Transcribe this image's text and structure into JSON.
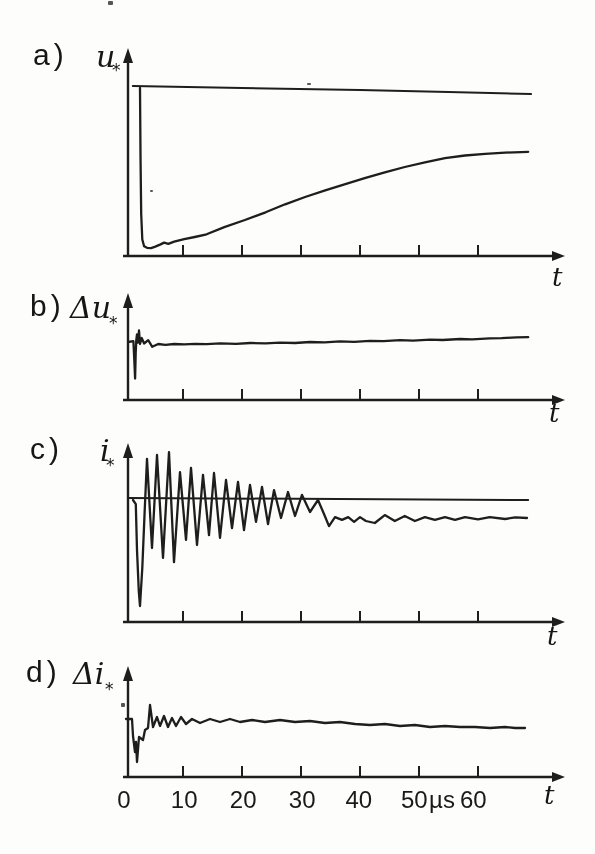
{
  "figure": {
    "background": "#fdfdfb",
    "ink": "#1e1e1e",
    "x_axis_unit": "µs",
    "x_axis_labels": [
      {
        "text": "0",
        "t_us": 0
      },
      {
        "text": "10",
        "t_us": 10.2
      },
      {
        "text": "20",
        "t_us": 20.2
      },
      {
        "text": "30",
        "t_us": 30.2
      },
      {
        "text": "40",
        "t_us": 39.8
      },
      {
        "text": "50",
        "t_us": 49.2
      },
      {
        "text": "µs",
        "t_us": 53.9
      },
      {
        "text": "60",
        "t_us": 59.2
      }
    ]
  },
  "chart_data": [
    {
      "type": "line",
      "panel": "a",
      "tag": "a)",
      "ylabel": "u",
      "ylabel_sub": "*",
      "xlabel": "t",
      "x_unit": "µs",
      "x_range_us": [
        0,
        74
      ],
      "x_ticks_us": [
        10,
        20,
        30,
        40,
        50,
        60
      ],
      "y_units": "normalized 0-1 of panel height",
      "series": [
        {
          "name": "reference-level",
          "role": "reference",
          "points": [
            [
              1.5,
              1.012
            ],
            [
              20,
              1.0
            ],
            [
              40,
              0.988
            ],
            [
              55,
              0.976
            ],
            [
              69,
              0.964
            ]
          ]
        },
        {
          "name": "u-transient",
          "role": "signal",
          "points": [
            [
              2.71,
              1.0
            ],
            [
              2.8,
              0.6
            ],
            [
              2.92,
              0.25
            ],
            [
              3.1,
              0.098
            ],
            [
              3.4,
              0.058
            ],
            [
              3.9,
              0.049
            ],
            [
              4.6,
              0.047
            ],
            [
              5.3,
              0.056
            ],
            [
              6.1,
              0.068
            ],
            [
              6.8,
              0.08
            ],
            [
              7.5,
              0.072
            ],
            [
              8.5,
              0.086
            ],
            [
              10.2,
              0.1
            ],
            [
              12,
              0.113
            ],
            [
              14,
              0.129
            ],
            [
              17,
              0.172
            ],
            [
              20.5,
              0.214
            ],
            [
              24,
              0.26
            ],
            [
              27.3,
              0.308
            ],
            [
              30.7,
              0.351
            ],
            [
              34.1,
              0.391
            ],
            [
              37.5,
              0.428
            ],
            [
              40.8,
              0.463
            ],
            [
              44.2,
              0.498
            ],
            [
              47.6,
              0.53
            ],
            [
              51,
              0.558
            ],
            [
              54.4,
              0.582
            ],
            [
              57.8,
              0.598
            ],
            [
              61.2,
              0.608
            ],
            [
              64.6,
              0.615
            ],
            [
              68.5,
              0.62
            ]
          ]
        }
      ]
    },
    {
      "type": "line",
      "panel": "b",
      "tag": "b)",
      "ylabel": "Δu",
      "ylabel_sub": "*",
      "xlabel": "t",
      "x_unit": "µs",
      "x_range_us": [
        0,
        74
      ],
      "x_ticks_us": [
        10,
        20,
        30,
        40,
        50,
        60
      ],
      "y_units": "normalized 0-1 of panel height",
      "series": [
        {
          "name": "delta-u",
          "role": "signal",
          "points": [
            [
              0.7,
              0.58
            ],
            [
              1.6,
              0.588
            ],
            [
              1.75,
              0.4
            ],
            [
              1.88,
              0.215
            ],
            [
              1.98,
              0.47
            ],
            [
              2.08,
              0.6
            ],
            [
              2.2,
              0.655
            ],
            [
              2.37,
              0.575
            ],
            [
              2.55,
              0.695
            ],
            [
              2.72,
              0.56
            ],
            [
              3,
              0.62
            ],
            [
              3.4,
              0.565
            ],
            [
              4.1,
              0.598
            ],
            [
              4.8,
              0.532
            ],
            [
              5.8,
              0.56
            ],
            [
              7,
              0.552
            ],
            [
              8.5,
              0.56
            ],
            [
              10.2,
              0.556
            ],
            [
              12,
              0.562
            ],
            [
              14,
              0.558
            ],
            [
              16.3,
              0.566
            ],
            [
              19,
              0.562
            ],
            [
              21.4,
              0.57
            ],
            [
              24,
              0.566
            ],
            [
              26.4,
              0.574
            ],
            [
              29,
              0.57
            ],
            [
              31.5,
              0.58
            ],
            [
              34,
              0.576
            ],
            [
              36.6,
              0.586
            ],
            [
              39,
              0.582
            ],
            [
              41.7,
              0.592
            ],
            [
              44,
              0.588
            ],
            [
              46.8,
              0.598
            ],
            [
              49,
              0.594
            ],
            [
              51.9,
              0.604
            ],
            [
              54,
              0.6
            ],
            [
              57,
              0.61
            ],
            [
              59,
              0.606
            ],
            [
              62,
              0.616
            ],
            [
              64,
              0.618
            ],
            [
              66.5,
              0.626
            ],
            [
              68.5,
              0.628
            ]
          ]
        }
      ]
    },
    {
      "type": "line",
      "panel": "c",
      "tag": "c)",
      "ylabel": "i",
      "ylabel_sub": "*",
      "xlabel": "t",
      "x_unit": "µs",
      "x_range_us": [
        0,
        74
      ],
      "x_ticks_us": [
        10,
        20,
        30,
        40,
        50,
        60
      ],
      "y_units": "normalized 0-1 of panel height",
      "series": [
        {
          "name": "reference-level",
          "role": "reference",
          "points": [
            [
              0.7,
              0.689
            ],
            [
              68.5,
              0.678
            ]
          ]
        },
        {
          "name": "i-oscillation",
          "role": "signal",
          "points": [
            [
              1.53,
              0.678
            ],
            [
              2.0,
              0.655
            ],
            [
              2.2,
              0.4
            ],
            [
              2.5,
              0.17
            ],
            [
              2.71,
              0.089
            ],
            [
              3.1,
              0.3
            ],
            [
              3.5,
              0.62
            ],
            [
              3.9,
              0.906
            ],
            [
              4.75,
              0.411
            ],
            [
              5.59,
              0.928
            ],
            [
              6.61,
              0.356
            ],
            [
              7.63,
              0.944
            ],
            [
              8.47,
              0.333
            ],
            [
              9.49,
              0.833
            ],
            [
              10.51,
              0.456
            ],
            [
              11.36,
              0.856
            ],
            [
              12.37,
              0.428
            ],
            [
              13.39,
              0.817
            ],
            [
              14.41,
              0.483
            ],
            [
              15.25,
              0.828
            ],
            [
              16.27,
              0.467
            ],
            [
              17.29,
              0.789
            ],
            [
              18.31,
              0.522
            ],
            [
              19.32,
              0.778
            ],
            [
              20.34,
              0.511
            ],
            [
              21.36,
              0.761
            ],
            [
              22.37,
              0.556
            ],
            [
              23.39,
              0.75
            ],
            [
              24.41,
              0.544
            ],
            [
              25.42,
              0.733
            ],
            [
              26.61,
              0.578
            ],
            [
              27.8,
              0.722
            ],
            [
              28.98,
              0.589
            ],
            [
              30.17,
              0.706
            ],
            [
              31.53,
              0.611
            ],
            [
              32.88,
              0.678
            ],
            [
              33.9,
              0.6
            ],
            [
              34.75,
              0.533
            ],
            [
              35.76,
              0.583
            ],
            [
              36.95,
              0.567
            ],
            [
              38,
              0.583
            ],
            [
              39,
              0.556
            ],
            [
              40,
              0.583
            ],
            [
              41,
              0.561
            ],
            [
              42.5,
              0.55
            ],
            [
              44.2,
              0.594
            ],
            [
              45.9,
              0.561
            ],
            [
              47.6,
              0.589
            ],
            [
              49.3,
              0.561
            ],
            [
              51,
              0.583
            ],
            [
              52.7,
              0.567
            ],
            [
              54.4,
              0.583
            ],
            [
              56.1,
              0.567
            ],
            [
              57.8,
              0.583
            ],
            [
              60,
              0.57
            ],
            [
              62,
              0.583
            ],
            [
              64.6,
              0.572
            ],
            [
              66.3,
              0.581
            ],
            [
              68.3,
              0.578
            ]
          ]
        }
      ]
    },
    {
      "type": "line",
      "panel": "d",
      "tag": "d)",
      "ylabel": "Δi",
      "ylabel_sub": "*",
      "xlabel": "t",
      "x_unit": "µs",
      "x_range_us": [
        0,
        74
      ],
      "x_ticks_us": [
        10,
        20,
        30,
        40,
        50,
        60
      ],
      "y_units": "normalized 0-1 of panel height",
      "series": [
        {
          "name": "delta-i",
          "role": "signal",
          "points": [
            [
              0.34,
              0.527
            ],
            [
              1.36,
              0.527
            ],
            [
              1.53,
              0.373
            ],
            [
              1.7,
              0.3
            ],
            [
              1.86,
              0.227
            ],
            [
              2.03,
              0.318
            ],
            [
              2.2,
              0.136
            ],
            [
              2.54,
              0.364
            ],
            [
              3.22,
              0.336
            ],
            [
              3.56,
              0.427
            ],
            [
              4.07,
              0.445
            ],
            [
              4.41,
              0.655
            ],
            [
              4.92,
              0.455
            ],
            [
              5.59,
              0.545
            ],
            [
              6.1,
              0.464
            ],
            [
              6.78,
              0.555
            ],
            [
              7.46,
              0.455
            ],
            [
              8.14,
              0.536
            ],
            [
              8.81,
              0.464
            ],
            [
              9.66,
              0.545
            ],
            [
              10.51,
              0.482
            ],
            [
              11.53,
              0.527
            ],
            [
              12.88,
              0.491
            ],
            [
              14.58,
              0.527
            ],
            [
              16.27,
              0.5
            ],
            [
              17.97,
              0.527
            ],
            [
              19.66,
              0.5
            ],
            [
              21.69,
              0.518
            ],
            [
              23.9,
              0.5
            ],
            [
              26.44,
              0.518
            ],
            [
              28.98,
              0.5
            ],
            [
              31.53,
              0.509
            ],
            [
              34.07,
              0.491
            ],
            [
              36.61,
              0.5
            ],
            [
              39.15,
              0.482
            ],
            [
              41.69,
              0.473
            ],
            [
              44.24,
              0.482
            ],
            [
              46.78,
              0.464
            ],
            [
              49.32,
              0.473
            ],
            [
              51.86,
              0.455
            ],
            [
              54.41,
              0.464
            ],
            [
              56.95,
              0.455
            ],
            [
              59.49,
              0.455
            ],
            [
              62.03,
              0.445
            ],
            [
              64.58,
              0.455
            ],
            [
              66.27,
              0.445
            ],
            [
              67.97,
              0.445
            ]
          ]
        }
      ]
    }
  ]
}
